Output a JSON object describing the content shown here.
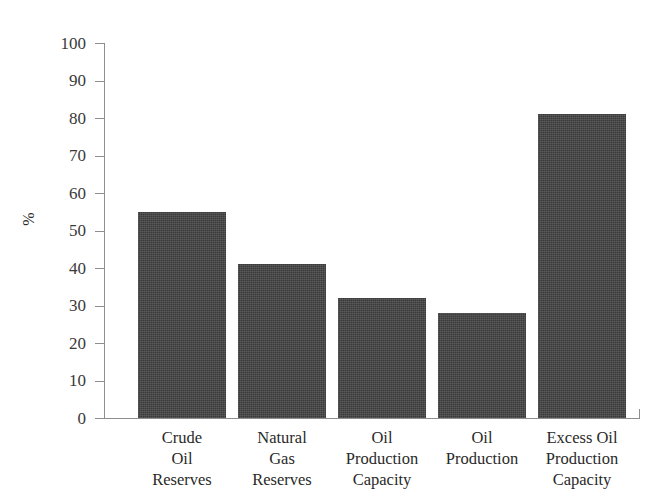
{
  "chart_data": {
    "type": "bar",
    "title": "",
    "xlabel": "",
    "ylabel": "%",
    "ylim": [
      0,
      100
    ],
    "yticks": [
      0,
      10,
      20,
      30,
      40,
      50,
      60,
      70,
      80,
      90,
      100
    ],
    "grid": false,
    "legend": null,
    "categories": [
      "Crude Oil Reserves",
      "Natural Gas Reserves",
      "Oil Production Capacity",
      "Oil Production",
      "Excess Oil Production Capacity"
    ],
    "category_lines": [
      [
        "Crude",
        "Oil",
        "Reserves"
      ],
      [
        "Natural",
        "Gas",
        "Reserves"
      ],
      [
        "Oil",
        "Production",
        "Capacity"
      ],
      [
        "Oil",
        "Production"
      ],
      [
        "Excess Oil",
        "Production",
        "Capacity"
      ]
    ],
    "values": [
      55,
      41,
      32,
      28,
      81
    ],
    "bar_color": "#3b3b3b",
    "axis_color": "#8e8e8e",
    "background": "#ffffff"
  },
  "axis": {
    "y_tick_labels": [
      "100",
      "90",
      "80",
      "70",
      "60",
      "50",
      "40",
      "30",
      "20",
      "10",
      "0"
    ],
    "y_axis_title": "%"
  }
}
